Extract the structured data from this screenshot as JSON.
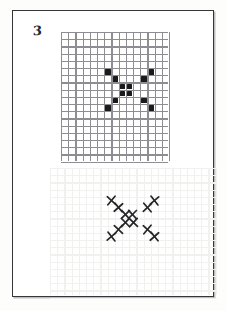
{
  "page": {
    "sheet_number": "3",
    "background_color": "#fdfdfc",
    "frame_color": "#35353a",
    "paper_color": "#ffffff"
  },
  "top_panel": {
    "name": "pattern-grid-filled",
    "grid_line_color": "#8e8e92",
    "fill_color": "#1a1a1c",
    "columns": 15,
    "rows": 18,
    "cell_size_px": 7.2
  },
  "bottom_panel": {
    "name": "pattern-grid-marks",
    "grid_line_color": "#f1f1f0",
    "mark_color": "#26262a",
    "mark_glyph": "x-mark",
    "columns": 23,
    "rows": 18,
    "cell_size_px": 7.2
  },
  "chart_data": {
    "type": "heatmap",
    "title": "",
    "subtitle": "",
    "xlabel": "",
    "ylabel": "",
    "grid": true,
    "legend": "none",
    "categories": [],
    "filled_cell_count": 12,
    "mark_count": 12,
    "pattern_cols": 7,
    "pattern_rows": 7,
    "top_grid_cells": [
      {
        "col": 6,
        "row": 5
      },
      {
        "col": 12,
        "row": 5
      },
      {
        "col": 7,
        "row": 6
      },
      {
        "col": 11,
        "row": 6
      },
      {
        "col": 8,
        "row": 7
      },
      {
        "col": 9,
        "row": 7
      },
      {
        "col": 8,
        "row": 8
      },
      {
        "col": 9,
        "row": 8
      },
      {
        "col": 7,
        "row": 9
      },
      {
        "col": 11,
        "row": 9
      },
      {
        "col": 6,
        "row": 10
      },
      {
        "col": 12,
        "row": 10
      }
    ],
    "bottom_grid_marks": [
      {
        "col": 8,
        "row": 4
      },
      {
        "col": 14,
        "row": 4
      },
      {
        "col": 9,
        "row": 5
      },
      {
        "col": 13,
        "row": 5
      },
      {
        "col": 10,
        "row": 6
      },
      {
        "col": 11,
        "row": 6
      },
      {
        "col": 10,
        "row": 7
      },
      {
        "col": 11,
        "row": 7
      },
      {
        "col": 9,
        "row": 8
      },
      {
        "col": 13,
        "row": 8
      },
      {
        "col": 8,
        "row": 9
      },
      {
        "col": 14,
        "row": 9
      }
    ]
  }
}
